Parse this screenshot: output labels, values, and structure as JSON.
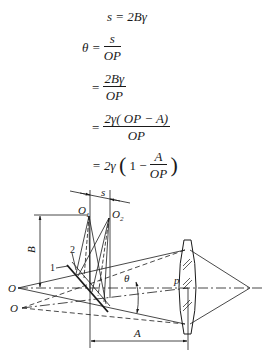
{
  "equations": {
    "line1": "s = 2Bγ",
    "line2": {
      "lhs": "θ =",
      "num": "s",
      "den": "OP"
    },
    "line3": {
      "lhs": "=",
      "num": "2Bγ",
      "den": "OP"
    },
    "line4": {
      "lhs": "=",
      "num": "2γ( OP − A)",
      "den": "OP"
    },
    "line5": {
      "lhs": "= 2γ",
      "open": "(",
      "one": "1 −",
      "num": "A",
      "den": "OP",
      "close": ")"
    }
  },
  "diagram": {
    "labels": {
      "s": "s",
      "O1": "O",
      "O1_sub": "1",
      "O2": "O",
      "O2_sub": "2",
      "B": "B",
      "num1": "1",
      "num2": "2",
      "O_upper": "O",
      "O_lower": "O",
      "theta": "θ",
      "p": "p",
      "A": "A"
    }
  }
}
